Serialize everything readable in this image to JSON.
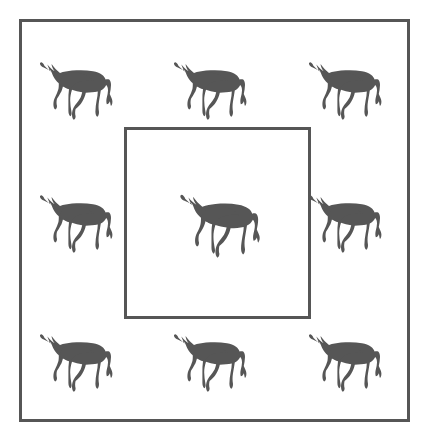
{
  "figure": {
    "type": "diagram",
    "title": "",
    "background_color": "#ffffff",
    "canvas": {
      "width": 428,
      "height": 436
    },
    "outer_frame": {
      "name": "outer-boundary-rectangle",
      "x": 19,
      "y": 19,
      "width": 391,
      "height": 403,
      "stroke_color": "#565656",
      "stroke_width": 3,
      "fill": "none",
      "label": ""
    },
    "inner_frame": {
      "name": "inner-highlight-square",
      "x": 124,
      "y": 127,
      "width": 187,
      "height": 192,
      "stroke_color": "#565656",
      "stroke_width": 3,
      "fill": "none",
      "label": ""
    },
    "icon": {
      "semantic_name": "cow-silhouette-icon",
      "fill_color": "#565656",
      "orientation": "facing-left",
      "count_total": 9,
      "count_inside_inner_frame": 1,
      "count_outside_inner_frame": 8,
      "grid": {
        "rows": 3,
        "cols": 3
      }
    },
    "animals": [
      {
        "id": "cow-r1-c1",
        "row": 1,
        "col": 1,
        "x": 36,
        "y": 55,
        "width": 84,
        "height": 66,
        "inside_inner_frame": false
      },
      {
        "id": "cow-r1-c2",
        "row": 1,
        "col": 2,
        "x": 170,
        "y": 55,
        "width": 84,
        "height": 66,
        "inside_inner_frame": false
      },
      {
        "id": "cow-r1-c3",
        "row": 1,
        "col": 3,
        "x": 305,
        "y": 55,
        "width": 84,
        "height": 66,
        "inside_inner_frame": false
      },
      {
        "id": "cow-r2-c1",
        "row": 2,
        "col": 1,
        "x": 36,
        "y": 188,
        "width": 84,
        "height": 66,
        "inside_inner_frame": false
      },
      {
        "id": "cow-r2-c2",
        "row": 2,
        "col": 2,
        "x": 176,
        "y": 187,
        "width": 92,
        "height": 72,
        "inside_inner_frame": true
      },
      {
        "id": "cow-r2-c3",
        "row": 2,
        "col": 3,
        "x": 305,
        "y": 188,
        "width": 84,
        "height": 66,
        "inside_inner_frame": false
      },
      {
        "id": "cow-r3-c1",
        "row": 3,
        "col": 1,
        "x": 36,
        "y": 327,
        "width": 84,
        "height": 66,
        "inside_inner_frame": false
      },
      {
        "id": "cow-r3-c2",
        "row": 3,
        "col": 2,
        "x": 170,
        "y": 327,
        "width": 84,
        "height": 66,
        "inside_inner_frame": false
      },
      {
        "id": "cow-r3-c3",
        "row": 3,
        "col": 3,
        "x": 305,
        "y": 327,
        "width": 84,
        "height": 66,
        "inside_inner_frame": false
      }
    ]
  }
}
